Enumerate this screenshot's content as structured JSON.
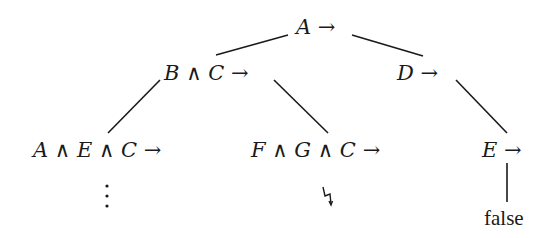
{
  "diagram": {
    "type": "derivation-tree",
    "nodes": {
      "root": {
        "label": "A →",
        "parts": [
          "A",
          "→"
        ]
      },
      "left": {
        "label": "B ∧ C →",
        "parts": [
          "B",
          "∧",
          "C",
          "→"
        ]
      },
      "right": {
        "label": "D →",
        "parts": [
          "D",
          "→"
        ]
      },
      "left_left": {
        "label": "A ∧ E ∧ C →",
        "parts": [
          "A",
          "∧",
          "E",
          "∧",
          "C",
          "→"
        ]
      },
      "left_right": {
        "label": "F ∧ G ∧ C →",
        "parts": [
          "F",
          "∧",
          "G",
          "∧",
          "C",
          "→"
        ]
      },
      "right_child": {
        "label": "E →",
        "parts": [
          "E",
          "→"
        ]
      },
      "left_left_cont": {
        "label": "⋮"
      },
      "left_right_leaf": {
        "label": "ϟ"
      },
      "right_leaf": {
        "label": "false"
      }
    },
    "edges": [
      {
        "from": "root",
        "to": "left"
      },
      {
        "from": "root",
        "to": "right"
      },
      {
        "from": "left",
        "to": "left_left"
      },
      {
        "from": "left",
        "to": "left_right"
      },
      {
        "from": "right",
        "to": "right_child"
      },
      {
        "from": "right_child",
        "to": "right_leaf"
      }
    ],
    "colors": {
      "ink": "#1a1a1a",
      "background": "#ffffff"
    }
  }
}
